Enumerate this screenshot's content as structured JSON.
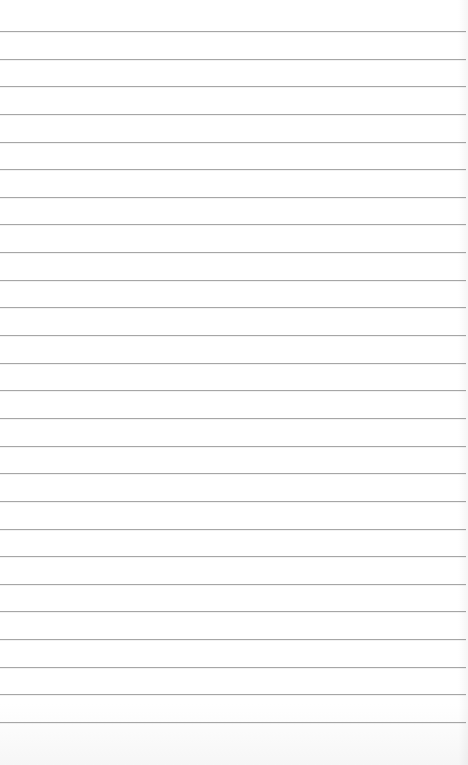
{
  "paper": {
    "type": "lined-paper",
    "background_color": "#ffffff",
    "line_color": "#a6a6a6",
    "line_count": 26,
    "first_line_y": 31,
    "line_spacing": 27.64,
    "text": ""
  }
}
